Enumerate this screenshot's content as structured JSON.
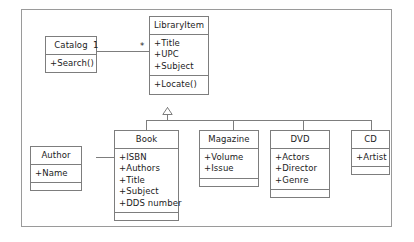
{
  "diagram": {
    "type": "uml-class-diagram",
    "classes": [
      {
        "id": "catalog",
        "name": "Catalog",
        "attributes": [],
        "operations": [
          "+Search()"
        ]
      },
      {
        "id": "libraryitem",
        "name": "LibraryItem",
        "attributes": [
          "+Title",
          "+UPC",
          "+Subject"
        ],
        "operations": [
          "+Locate()"
        ]
      },
      {
        "id": "book",
        "name": "Book",
        "attributes": [
          "+ISBN",
          "+Authors",
          "+Title",
          "+Subject",
          "+DDS number"
        ],
        "operations": []
      },
      {
        "id": "magazine",
        "name": "Magazine",
        "attributes": [
          "+Volume",
          "+Issue"
        ],
        "operations": []
      },
      {
        "id": "dvd",
        "name": "DVD",
        "attributes": [
          "+Actors",
          "+Director",
          "+Genre"
        ],
        "operations": []
      },
      {
        "id": "cd",
        "name": "CD",
        "attributes": [
          "+Artist"
        ],
        "operations": []
      },
      {
        "id": "author",
        "name": "Author",
        "attributes": [
          "+Name"
        ],
        "operations": []
      }
    ],
    "relationships": [
      {
        "kind": "association",
        "from": "catalog",
        "to": "libraryitem",
        "source_multiplicity": "1",
        "target_multiplicity": "*"
      },
      {
        "kind": "generalization",
        "parent": "libraryitem",
        "children": [
          "book",
          "magazine",
          "dvd",
          "cd"
        ]
      },
      {
        "kind": "association",
        "from": "author",
        "to": "book",
        "source_multiplicity": "",
        "target_multiplicity": ""
      }
    ],
    "multiplicity_labels": {
      "catalog_side": "1",
      "libraryitem_side": "*"
    },
    "colors": {
      "line": "#7d7d7d",
      "frame": "#9a9a9a",
      "text": "#1b1b1b",
      "background": "#ffffff"
    }
  }
}
